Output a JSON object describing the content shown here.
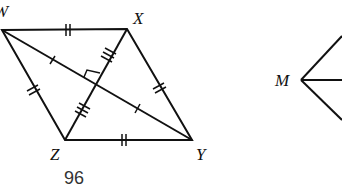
{
  "figure": {
    "page_number": "96",
    "rhombus": {
      "vertices": {
        "W": "W",
        "X": "X",
        "Y": "Y",
        "Z": "Z"
      },
      "marks": {
        "sides": "double tick (all four sides congruent)",
        "diagonal_WY": "single tick on each half",
        "diagonal_XZ": "triple tick on each half",
        "right_angle": "at diagonal intersection"
      }
    },
    "angle_figure": {
      "vertex": "M",
      "rays": 3
    }
  }
}
